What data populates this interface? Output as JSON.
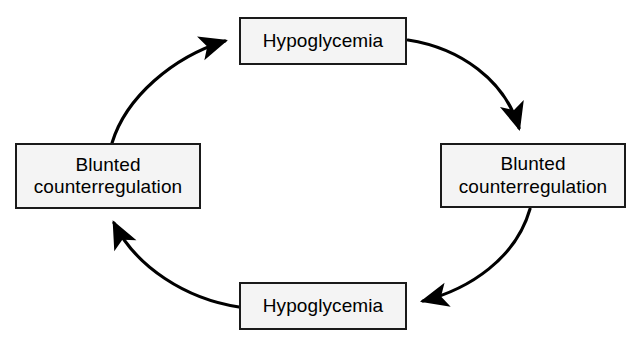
{
  "diagram": {
    "type": "cycle-diagram",
    "direction": "clockwise-top-right, counterclockwise-bottom-left",
    "background_color": "#ffffff",
    "box_fill_color": "#f4f4f4",
    "box_border_color": "#1a1a1a",
    "arrow_color": "#000000",
    "nodes": [
      {
        "id": "top",
        "label": "Hypoglycemia",
        "position": "top-center"
      },
      {
        "id": "right",
        "label": "Blunted\ncounterregulation",
        "position": "middle-right"
      },
      {
        "id": "bottom",
        "label": "Hypoglycemia",
        "position": "bottom-center"
      },
      {
        "id": "left",
        "label": "Blunted\ncounterregulation",
        "position": "middle-left"
      }
    ],
    "arrows": [
      {
        "id": "top-to-right",
        "from": "top",
        "to": "right",
        "shape": "curved",
        "label": ""
      },
      {
        "id": "right-to-bottom",
        "from": "right",
        "to": "bottom",
        "shape": "curved",
        "label": ""
      },
      {
        "id": "bottom-to-left",
        "from": "bottom",
        "to": "left",
        "shape": "curved",
        "label": ""
      },
      {
        "id": "left-to-top",
        "from": "left",
        "to": "top",
        "shape": "curved",
        "label": ""
      }
    ]
  }
}
